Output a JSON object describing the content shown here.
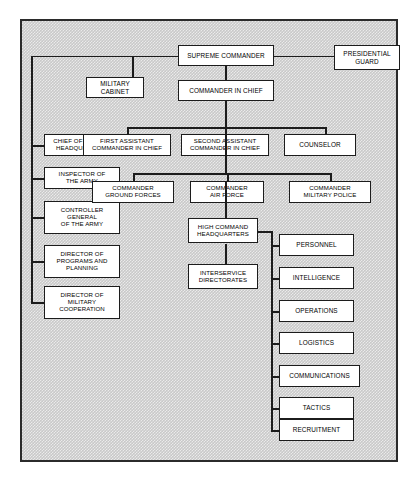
{
  "chart": {
    "type": "diagram",
    "title": "",
    "subtype": "organizational-hierarchy",
    "background_color": "#c9c9c9",
    "border_color": "#2b2b2b",
    "node_fill": "#ffffff",
    "node_border": "#1c1c1c",
    "nodes": {
      "supreme_commander": "SUPREME COMMANDER",
      "presidential_guard": "PRESIDENTIAL\nGUARD",
      "military_cabinet": "MILITARY\nCABINET",
      "commander_in_chief": "COMMANDER IN CHIEF",
      "chief_special_hq": "CHIEF OF SPECIAL\nHEADQUARTERS",
      "inspector_army": "INSPECTOR OF\nTHE ARMY",
      "controller_general": "CONTROLLER\nGENERAL\nOF THE ARMY",
      "director_programs": "DIRECTOR OF\nPROGRAMS AND\nPLANNING",
      "director_military_coop": "DIRECTOR OF\nMILITARY\nCOOPERATION",
      "first_assistant": "FIRST ASSISTANT\nCOMMANDER IN CHIEF",
      "second_assistant": "SECOND ASSISTANT\nCOMMANDER IN CHIEF",
      "counselor": "COUNSELOR",
      "commander_ground": "COMMANDER\nGROUND FORCES",
      "commander_air": "COMMANDER\nAIR FORCE",
      "commander_police": "COMMANDER\nMILITARY POLICE",
      "high_command_hq": "HIGH COMMAND\nHEADQUARTERS",
      "interservice": "INTERSERVICE\nDIRECTORATES"
    },
    "directorates": [
      "PERSONNEL",
      "INTELLIGENCE",
      "OPERATIONS",
      "LOGISTICS",
      "COMMUNICATIONS",
      "TACTICS",
      "RECRUITMENT"
    ]
  }
}
